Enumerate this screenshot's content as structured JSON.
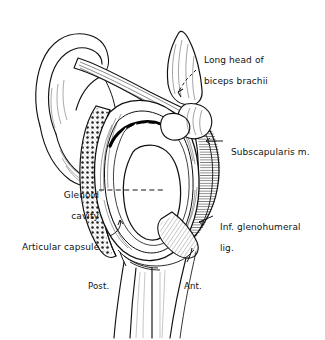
{
  "figure": {
    "view": "lateral view of right glenoid fossa with humerus reflected",
    "background_color": "#ffffff",
    "ink_color": "#101010",
    "width": 325,
    "height": 340
  },
  "labels": {
    "biceps": {
      "line1": "Long head of",
      "line2": "biceps brachii",
      "leader": "dashed-arrow-down-left"
    },
    "subscapularis": {
      "line1": "Subscapularis m.",
      "leader": "solid-line-left"
    },
    "inf_glenohumeral": {
      "line1": "Inf. glenohumeral",
      "line2": "lig.",
      "leader": "solid-line-left"
    },
    "glenoid_cavity": {
      "line1": "Glenoid",
      "line2": "cavity",
      "leader": "dashed-line-right"
    },
    "articular_capsule": {
      "line1": "Articular capsule",
      "leader": "hook-line-up-right"
    },
    "orientation_posterior": "Post.",
    "orientation_anterior": "Ant."
  },
  "structures": [
    {
      "name": "acromion-scapular-spine",
      "position": "upper-left"
    },
    {
      "name": "coracoid-process",
      "position": "upper-right"
    },
    {
      "name": "clavicle-tendon-band",
      "position": "upper-center-diagonal"
    },
    {
      "name": "glenoid-labrum-rim",
      "position": "center"
    },
    {
      "name": "glenoid-cavity-fossa",
      "position": "center"
    },
    {
      "name": "articular-capsule-cut-edge",
      "position": "left-margin"
    },
    {
      "name": "subscapularis-muscle",
      "position": "right-margin"
    },
    {
      "name": "inferior-glenohumeral-ligament",
      "position": "lower-right"
    },
    {
      "name": "humerus-shaft",
      "position": "bottom-center"
    }
  ]
}
